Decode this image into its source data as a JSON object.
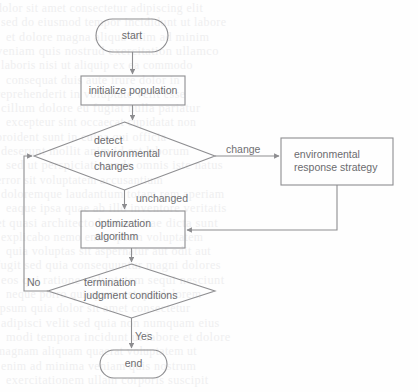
{
  "page": {
    "background_color": "#fefefe",
    "stroke_color": "#8d8d90",
    "text_color": "#6b6b6e",
    "bleed_text_color": "#efeff0"
  },
  "chart_data": {
    "type": "diagram",
    "diagram_type": "flowchart",
    "title": "",
    "orientation": "top-to-bottom",
    "nodes": [
      {
        "id": "start",
        "shape": "stadium",
        "label": "start",
        "x": 96,
        "y": 19,
        "w": 72,
        "h": 33
      },
      {
        "id": "init",
        "shape": "rectangle",
        "label": "initialize population",
        "x": 81,
        "y": 76,
        "w": 104,
        "h": 29
      },
      {
        "id": "detect",
        "shape": "diamond",
        "label": "detect\nenvironmental\nchanges",
        "x": 34,
        "y": 122,
        "w": 181,
        "h": 68
      },
      {
        "id": "response",
        "shape": "rectangle",
        "label": "environmental\nresponse strategy",
        "x": 281,
        "y": 138,
        "w": 112,
        "h": 47
      },
      {
        "id": "optimize",
        "shape": "rectangle",
        "label": "optimization\nalgorithm",
        "x": 81,
        "y": 211,
        "w": 104,
        "h": 37
      },
      {
        "id": "terminate",
        "shape": "diamond",
        "label": "termination\njudgment conditions",
        "x": 48,
        "y": 264,
        "w": 167,
        "h": 54
      },
      {
        "id": "end",
        "shape": "stadium",
        "label": "end",
        "x": 100,
        "y": 350,
        "w": 67,
        "h": 28
      }
    ],
    "edges": [
      {
        "from": "start",
        "to": "init",
        "label": "",
        "kind": "straight"
      },
      {
        "from": "init",
        "to": "detect",
        "label": "",
        "kind": "straight"
      },
      {
        "from": "detect",
        "to": "response",
        "label": "change",
        "kind": "straight"
      },
      {
        "from": "detect",
        "to": "optimize",
        "label": "unchanged",
        "kind": "straight"
      },
      {
        "from": "response",
        "to": "optimize",
        "label": "",
        "kind": "elbow-feedback-right"
      },
      {
        "from": "optimize",
        "to": "terminate",
        "label": "",
        "kind": "straight"
      },
      {
        "from": "terminate",
        "to": "detect",
        "label": "No",
        "kind": "elbow-feedback-left"
      },
      {
        "from": "terminate",
        "to": "end",
        "label": "Yes",
        "kind": "straight"
      }
    ]
  },
  "nodes": {
    "start": {
      "label": "start"
    },
    "init": {
      "label": "initialize population"
    },
    "detect": {
      "line1": "detect",
      "line2": "environmental",
      "line3": "changes"
    },
    "response": {
      "line1": "environmental",
      "line2": "response strategy"
    },
    "optimize": {
      "line1": "optimization",
      "line2": "algorithm"
    },
    "terminate": {
      "line1": "termination",
      "line2": "judgment conditions"
    },
    "end": {
      "label": "end"
    }
  },
  "edge_labels": {
    "change": "change",
    "unchanged": "unchanged",
    "no": "No",
    "yes": "Yes"
  },
  "background_bleed": {
    "note": "faint illegible mirrored text bleeding through from reverse side of scanned page",
    "lines": [
      "dolor sit amet consectetur adipiscing elit",
      "sed do eiusmod tempor incididunt ut labore",
      "et dolore magna aliqua enim ad minim",
      "veniam quis nostrud exercitation ullamco",
      "laboris nisi ut aliquip ex ea commodo",
      "consequat duis aute irure dolor in",
      "reprehenderit in voluptate velit esse",
      "cillum dolore eu fugiat nulla pariatur",
      "excepteur sint occaecat cupidatat non",
      "proident sunt in culpa qui officia",
      "deserunt mollit anim id est laborum",
      "sed ut perspiciatis unde omnis iste natus",
      "error sit voluptatem accusantium",
      "doloremque laudantium totam rem aperiam",
      "eaque ipsa quae ab illo inventore veritatis",
      "et quasi architecto beatae vitae dicta sunt",
      "explicabo nemo enim ipsam voluptatem",
      "quia voluptas sit aspernatur aut odit aut",
      "fugit sed quia consequuntur magni dolores",
      "eos qui ratione voluptatem sequi nesciunt",
      "neque porro quisquam est qui dolorem",
      "ipsum quia dolor sit amet consectetur",
      "adipisci velit sed quia non numquam eius",
      "modi tempora incidunt ut labore et dolore",
      "magnam aliquam quaerat voluptatem ut",
      "enim ad minima veniam quis nostrum",
      "exercitationem ullam corporis suscipit"
    ]
  }
}
